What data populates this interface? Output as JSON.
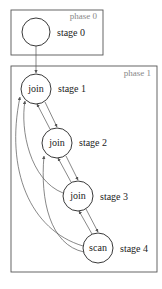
{
  "phases": [
    {
      "label": "phase 0"
    },
    {
      "label": "phase 1"
    }
  ],
  "stages": [
    {
      "op": "",
      "label": "stage 0"
    },
    {
      "op": "join",
      "label": "stage 1"
    },
    {
      "op": "join",
      "label": "stage 2"
    },
    {
      "op": "join",
      "label": "stage 3"
    },
    {
      "op": "scan",
      "label": "stage 4"
    }
  ],
  "edges": [
    {
      "from": "stage 0",
      "to": "stage 1"
    },
    {
      "from": "stage 1",
      "to": "stage 2"
    },
    {
      "from": "stage 2",
      "to": "stage 1"
    },
    {
      "from": "stage 2",
      "to": "stage 3"
    },
    {
      "from": "stage 3",
      "to": "stage 2"
    },
    {
      "from": "stage 3",
      "to": "stage 4"
    },
    {
      "from": "stage 4",
      "to": "stage 3"
    },
    {
      "from": "stage 3",
      "to": "stage 1"
    },
    {
      "from": "stage 4",
      "to": "stage 1"
    },
    {
      "from": "stage 4",
      "to": "stage 2"
    }
  ]
}
